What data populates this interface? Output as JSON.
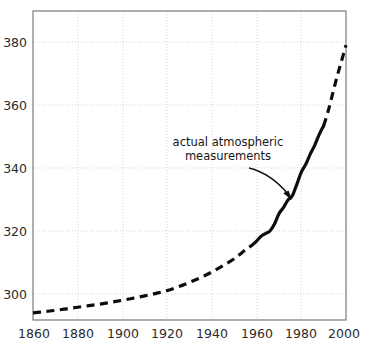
{
  "chart_data": {
    "type": "line",
    "title": "",
    "subtitle": "",
    "xlabel": "",
    "ylabel": "",
    "xlim": [
      1855,
      2002
    ],
    "ylim": [
      292,
      384
    ],
    "xticks": [
      1860,
      1880,
      1900,
      1920,
      1940,
      1960,
      1980,
      2000
    ],
    "yticks": [
      300,
      320,
      340,
      360,
      380
    ],
    "xtick_labels": [
      "1860",
      "1880",
      "1900",
      "1920",
      "1940",
      "1960",
      "1980",
      "2000"
    ],
    "ytick_labels": [
      "300",
      "320",
      "340",
      "360",
      "380"
    ],
    "grid": true,
    "grid_style": "dotted",
    "grid_color": "#cfcfcf",
    "legend": false,
    "legend_position": "none",
    "series": [
      {
        "name": "ice core / proxy record (dashed)",
        "style": "dashed",
        "color": "#0d0d0d",
        "x": [
          1860,
          1865,
          1870,
          1875,
          1880,
          1885,
          1890,
          1895,
          1900,
          1905,
          1910,
          1915,
          1920,
          1925,
          1930,
          1935,
          1940,
          1945,
          1950,
          1955,
          1958
        ],
        "values": [
          294.0,
          294.4,
          294.8,
          295.3,
          295.8,
          296.3,
          296.8,
          297.4,
          298.0,
          298.7,
          299.4,
          300.2,
          301.1,
          302.3,
          303.7,
          305.2,
          307.0,
          309.0,
          311.2,
          314.0,
          315.5
        ]
      },
      {
        "name": "actual atmospheric measurements (solid)",
        "style": "solid",
        "color": "#0d0d0d",
        "x": [
          1958,
          1960,
          1962,
          1964,
          1966,
          1968,
          1970,
          1972,
          1974,
          1976,
          1978,
          1980,
          1982,
          1984,
          1986,
          1988,
          1990
        ],
        "values": [
          315.5,
          316.8,
          318.3,
          319.2,
          320.0,
          322.2,
          325.5,
          327.4,
          329.8,
          331.2,
          334.8,
          338.7,
          341.2,
          344.4,
          347.2,
          350.6,
          353.4
        ]
      },
      {
        "name": "projection (dashed)",
        "style": "dashed",
        "color": "#0d0d0d",
        "x": [
          1990,
          1992,
          1994,
          1996,
          1998,
          2000
        ],
        "values": [
          353.4,
          358.0,
          363.5,
          369.0,
          374.0,
          379.0
        ]
      }
    ],
    "annotations": [
      {
        "name": "actual-measurements-label",
        "text_lines": [
          "actual atmospheric",
          "measurements"
        ],
        "text_x": 1920,
        "text_y": 347,
        "arrow_from": [
          1925,
          341
        ],
        "arrow_to": [
          1976,
          332
        ]
      }
    ]
  },
  "annotation": {
    "line1": "actual atmospheric",
    "line2": "measurements"
  },
  "axes": {
    "y_labels": [
      "380",
      "360",
      "340",
      "320",
      "300"
    ],
    "x_labels": [
      "1860",
      "1880",
      "1900",
      "1920",
      "1940",
      "1960",
      "1980",
      "2000"
    ]
  },
  "colors": {
    "series": "#0d0d0d",
    "grid": "#cfcfcf",
    "frame": "#6e6e6e",
    "text": "#1a1a1a",
    "background": "#ffffff"
  }
}
